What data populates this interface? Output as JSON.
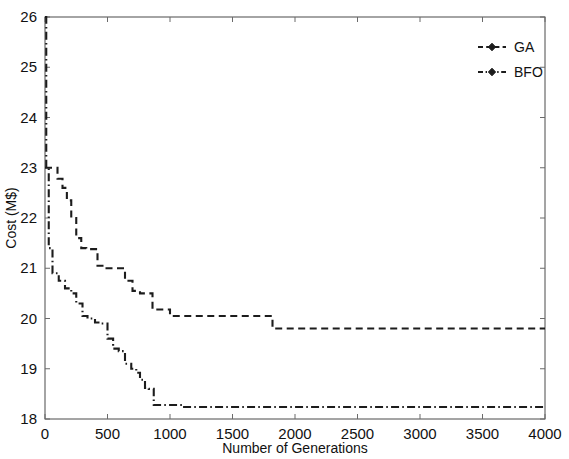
{
  "chart_data": {
    "type": "line",
    "title": "",
    "xlabel": "Number of Generations",
    "ylabel": "Cost (M$)",
    "xlim": [
      0,
      4000
    ],
    "ylim": [
      18,
      26
    ],
    "xticks": [
      0,
      500,
      1000,
      1500,
      2000,
      2500,
      3000,
      3500,
      4000
    ],
    "yticks": [
      18,
      19,
      20,
      21,
      22,
      23,
      24,
      25,
      26
    ],
    "xticklabels": [
      "0",
      "500",
      "1000",
      "1500",
      "2000",
      "2500",
      "3000",
      "3500",
      "4000"
    ],
    "yticklabels": [
      "18",
      "19",
      "20",
      "21",
      "22",
      "23",
      "24",
      "25",
      "26"
    ],
    "grid": false,
    "legend_position": "upper right",
    "drawstyle": "steps-post",
    "series": [
      {
        "name": "GA",
        "linestyle": "dashed",
        "marker": "diamond",
        "color": "#1c1c1c",
        "x": [
          0,
          60,
          100,
          140,
          175,
          210,
          250,
          290,
          330,
          420,
          470,
          590,
          640,
          700,
          760,
          860,
          1000,
          1820,
          4000
        ],
        "y": [
          23.0,
          23.0,
          22.78,
          22.6,
          22.35,
          22.0,
          21.6,
          21.4,
          21.38,
          21.05,
          21.0,
          21.0,
          20.75,
          20.55,
          20.5,
          20.18,
          20.05,
          19.8,
          19.8
        ],
        "start_value": 23.0,
        "final_value": 19.8
      },
      {
        "name": "BFO",
        "linestyle": "dashdot",
        "marker": "diamond",
        "color": "#1c1c1c",
        "x": [
          0,
          10,
          30,
          60,
          110,
          160,
          210,
          250,
          300,
          340,
          400,
          450,
          500,
          545,
          590,
          640,
          690,
          730,
          760,
          800,
          830,
          870,
          1000,
          1100,
          4000
        ],
        "y": [
          26.0,
          23.0,
          21.4,
          20.9,
          20.75,
          20.6,
          20.5,
          20.3,
          20.05,
          20.0,
          19.92,
          19.9,
          19.6,
          19.4,
          19.35,
          19.1,
          19.0,
          18.92,
          18.78,
          18.62,
          18.6,
          18.28,
          18.28,
          18.24,
          18.24
        ],
        "start_value": 26.0,
        "final_value": 18.25
      }
    ],
    "legend_entries": [
      {
        "label": "GA",
        "linestyle": "dashed",
        "marker": "diamond"
      },
      {
        "label": "BFO",
        "linestyle": "dashdot",
        "marker": "diamond"
      }
    ]
  }
}
